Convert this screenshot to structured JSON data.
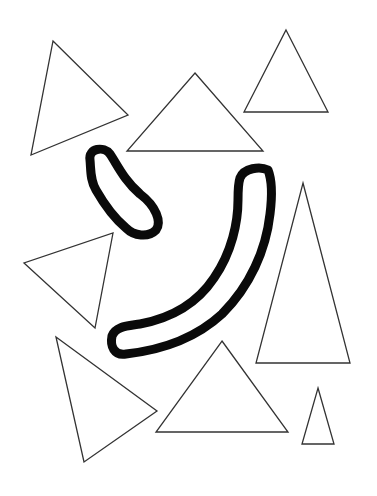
{
  "canvas": {
    "width": 377,
    "height": 496,
    "background": "#ffffff"
  },
  "colors": {
    "triangle_stroke": "#333333",
    "blob_stroke": "#0a0a0a"
  },
  "shapes": {
    "triangles": [
      {
        "id": "triangle-top-left",
        "points": "53,41 128,115 31,155"
      },
      {
        "id": "triangle-top-center",
        "points": "195,73 263,151 127,151"
      },
      {
        "id": "triangle-top-right",
        "points": "286,30 328,112 244,112"
      },
      {
        "id": "triangle-left-middle",
        "points": "113,233 95,328 24,263"
      },
      {
        "id": "triangle-bottom-left",
        "points": "56,337 157,411 84,462"
      },
      {
        "id": "triangle-bottom-center",
        "points": "222,341 288,432 156,432"
      },
      {
        "id": "triangle-right-tall",
        "points": "303,183 350,363 256,363"
      },
      {
        "id": "triangle-small-bottom-right",
        "points": "318,388 334,444 302,444"
      }
    ],
    "blobs": [
      {
        "id": "blob-short-curved",
        "d": "M 90 160 C 88 148, 104 146, 110 154 C 118 166, 124 180, 140 194 C 156 206, 162 222, 156 230 C 148 238, 134 236, 126 228 C 114 218, 104 204, 96 190 C 90 180, 91 170, 90 160 Z"
      },
      {
        "id": "blob-long-curved",
        "d": "M 240 178 C 244 168, 260 166, 268 170 C 272 180, 272 198, 270 214 C 266 250, 250 286, 222 314 C 196 338, 162 350, 126 354 C 114 356, 110 346, 112 336 C 116 326, 128 326, 140 324 C 172 318, 198 302, 214 278 C 232 252, 238 222, 238 200 C 238 192, 238 184, 240 178 Z"
      }
    ]
  }
}
